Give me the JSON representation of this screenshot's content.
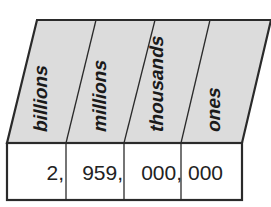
{
  "diagram": {
    "type": "place-value-chart",
    "headers": [
      {
        "label": "billions"
      },
      {
        "label": "millions"
      },
      {
        "label": "thousands"
      },
      {
        "label": "ones"
      }
    ],
    "values": [
      {
        "digits": "2,"
      },
      {
        "digits": "959,"
      },
      {
        "digits": "000,"
      },
      {
        "digits": "000"
      }
    ],
    "colors": {
      "header_fill": "#dcdcdc",
      "cell_fill": "#ffffff",
      "stroke": "#2a2a2a"
    }
  }
}
